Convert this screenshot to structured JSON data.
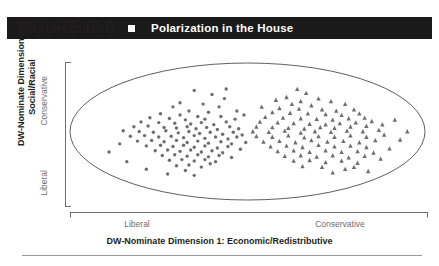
{
  "header": {
    "figure_number": "FIGURE 15.6",
    "bullet_icon": "square-bullet-icon",
    "title": "Polarization in the House",
    "background_color": "#1a1a1a",
    "text_color": "#ffffff"
  },
  "chart_data": {
    "type": "scatter",
    "title": "Polarization in the House",
    "xlabel": "DW-Nominate Dimension 1: Economic/Redistributive",
    "ylabel_line1": "DW-Nominate Dimension 2:",
    "ylabel_line2": "Social/Racial",
    "xtick_labels": [
      "Liberal",
      "Conservative"
    ],
    "ytick_labels": [
      "Liberal",
      "Conservative"
    ],
    "xlim": [
      -1,
      1
    ],
    "ylim": [
      -1,
      1
    ],
    "grid": false,
    "legend": "none",
    "boundary_shape": "ellipse",
    "marker_color": "#6d6e70",
    "series": [
      {
        "name": "Democrats",
        "marker": "circle",
        "cluster_center": [
          -0.45,
          0.0
        ],
        "points": [
          [
            -0.3,
            0.6
          ],
          [
            -0.2,
            0.54
          ],
          [
            -0.12,
            0.62
          ],
          [
            -0.38,
            0.42
          ],
          [
            -0.25,
            0.4
          ],
          [
            -0.42,
            0.36
          ],
          [
            -0.16,
            0.36
          ],
          [
            -0.33,
            0.3
          ],
          [
            -0.49,
            0.26
          ],
          [
            -0.22,
            0.28
          ],
          [
            -0.38,
            0.24
          ],
          [
            -0.28,
            0.22
          ],
          [
            -0.55,
            0.2
          ],
          [
            -0.44,
            0.19
          ],
          [
            -0.35,
            0.17
          ],
          [
            -0.24,
            0.18
          ],
          [
            -0.15,
            0.22
          ],
          [
            -0.6,
            0.14
          ],
          [
            -0.5,
            0.13
          ],
          [
            -0.41,
            0.12
          ],
          [
            -0.32,
            0.11
          ],
          [
            -0.26,
            0.13
          ],
          [
            -0.19,
            0.1
          ],
          [
            -0.12,
            0.14
          ],
          [
            -0.07,
            0.18
          ],
          [
            -0.64,
            0.07
          ],
          [
            -0.56,
            0.08
          ],
          [
            -0.47,
            0.06
          ],
          [
            -0.4,
            0.05
          ],
          [
            -0.34,
            0.07
          ],
          [
            -0.29,
            0.04
          ],
          [
            -0.23,
            0.06
          ],
          [
            -0.17,
            0.03
          ],
          [
            -0.1,
            0.07
          ],
          [
            -0.05,
            0.04
          ],
          [
            -0.7,
            0.01
          ],
          [
            -0.61,
            0.0
          ],
          [
            -0.53,
            -0.01
          ],
          [
            -0.46,
            0.01
          ],
          [
            -0.39,
            -0.02
          ],
          [
            -0.33,
            0.0
          ],
          [
            -0.27,
            -0.03
          ],
          [
            -0.21,
            -0.01
          ],
          [
            -0.14,
            -0.04
          ],
          [
            -0.08,
            -0.01
          ],
          [
            -0.03,
            -0.05
          ],
          [
            -0.66,
            -0.07
          ],
          [
            -0.58,
            -0.06
          ],
          [
            -0.5,
            -0.08
          ],
          [
            -0.43,
            -0.07
          ],
          [
            -0.36,
            -0.09
          ],
          [
            -0.3,
            -0.06
          ],
          [
            -0.24,
            -0.1
          ],
          [
            -0.18,
            -0.08
          ],
          [
            -0.11,
            -0.11
          ],
          [
            -0.06,
            -0.08
          ],
          [
            -0.62,
            -0.14
          ],
          [
            -0.54,
            -0.13
          ],
          [
            -0.47,
            -0.15
          ],
          [
            -0.4,
            -0.13
          ],
          [
            -0.34,
            -0.16
          ],
          [
            -0.28,
            -0.14
          ],
          [
            -0.22,
            -0.17
          ],
          [
            -0.15,
            -0.15
          ],
          [
            -0.09,
            -0.18
          ],
          [
            -0.57,
            -0.21
          ],
          [
            -0.49,
            -0.2
          ],
          [
            -0.42,
            -0.22
          ],
          [
            -0.36,
            -0.2
          ],
          [
            -0.3,
            -0.23
          ],
          [
            -0.24,
            -0.21
          ],
          [
            -0.17,
            -0.24
          ],
          [
            -0.11,
            -0.22
          ],
          [
            -0.52,
            -0.28
          ],
          [
            -0.45,
            -0.27
          ],
          [
            -0.38,
            -0.29
          ],
          [
            -0.32,
            -0.27
          ],
          [
            -0.26,
            -0.3
          ],
          [
            -0.2,
            -0.28
          ],
          [
            -0.14,
            -0.31
          ],
          [
            -0.48,
            -0.35
          ],
          [
            -0.41,
            -0.34
          ],
          [
            -0.34,
            -0.36
          ],
          [
            -0.28,
            -0.34
          ],
          [
            -0.22,
            -0.37
          ],
          [
            -0.16,
            -0.35
          ],
          [
            -0.44,
            -0.42
          ],
          [
            -0.37,
            -0.41
          ],
          [
            -0.3,
            -0.43
          ],
          [
            -0.24,
            -0.41
          ],
          [
            -0.18,
            -0.44
          ],
          [
            -0.4,
            -0.5
          ],
          [
            -0.33,
            -0.49
          ],
          [
            -0.26,
            -0.52
          ],
          [
            -0.72,
            -0.18
          ],
          [
            -0.78,
            -0.3
          ],
          [
            -0.68,
            -0.44
          ],
          [
            -0.57,
            -0.55
          ],
          [
            -0.45,
            -0.62
          ],
          [
            -0.3,
            -0.64
          ],
          [
            -0.13,
            0.48
          ],
          [
            -0.06,
            0.3
          ],
          [
            -0.02,
            0.24
          ],
          [
            -0.01,
            -0.16
          ],
          [
            -0.04,
            -0.26
          ],
          [
            -0.09,
            -0.38
          ],
          [
            -0.21,
            -0.47
          ],
          [
            -0.35,
            -0.57
          ]
        ]
      },
      {
        "name": "Republicans",
        "marker": "triangle",
        "cluster_center": [
          0.4,
          0.0
        ],
        "points": [
          [
            0.28,
            0.62
          ],
          [
            0.33,
            0.56
          ],
          [
            0.22,
            0.5
          ],
          [
            0.4,
            0.48
          ],
          [
            0.3,
            0.44
          ],
          [
            0.47,
            0.44
          ],
          [
            0.25,
            0.4
          ],
          [
            0.36,
            0.38
          ],
          [
            0.55,
            0.4
          ],
          [
            0.18,
            0.34
          ],
          [
            0.29,
            0.33
          ],
          [
            0.42,
            0.32
          ],
          [
            0.5,
            0.3
          ],
          [
            0.6,
            0.32
          ],
          [
            0.14,
            0.28
          ],
          [
            0.24,
            0.27
          ],
          [
            0.34,
            0.26
          ],
          [
            0.44,
            0.25
          ],
          [
            0.53,
            0.24
          ],
          [
            0.63,
            0.26
          ],
          [
            0.1,
            0.21
          ],
          [
            0.2,
            0.2
          ],
          [
            0.3,
            0.19
          ],
          [
            0.39,
            0.18
          ],
          [
            0.48,
            0.17
          ],
          [
            0.57,
            0.19
          ],
          [
            0.66,
            0.2
          ],
          [
            0.07,
            0.14
          ],
          [
            0.17,
            0.13
          ],
          [
            0.26,
            0.12
          ],
          [
            0.35,
            0.11
          ],
          [
            0.44,
            0.1
          ],
          [
            0.52,
            0.12
          ],
          [
            0.61,
            0.13
          ],
          [
            0.7,
            0.15
          ],
          [
            0.05,
            0.07
          ],
          [
            0.14,
            0.06
          ],
          [
            0.23,
            0.05
          ],
          [
            0.32,
            0.04
          ],
          [
            0.41,
            0.06
          ],
          [
            0.49,
            0.05
          ],
          [
            0.58,
            0.07
          ],
          [
            0.67,
            0.08
          ],
          [
            0.76,
            0.1
          ],
          [
            0.03,
            0.0
          ],
          [
            0.12,
            -0.01
          ],
          [
            0.21,
            0.01
          ],
          [
            0.3,
            -0.02
          ],
          [
            0.38,
            0.0
          ],
          [
            0.47,
            -0.01
          ],
          [
            0.56,
            0.01
          ],
          [
            0.65,
            0.0
          ],
          [
            0.74,
            0.02
          ],
          [
            0.05,
            -0.07
          ],
          [
            0.14,
            -0.08
          ],
          [
            0.23,
            -0.06
          ],
          [
            0.32,
            -0.09
          ],
          [
            0.4,
            -0.07
          ],
          [
            0.49,
            -0.08
          ],
          [
            0.58,
            -0.06
          ],
          [
            0.67,
            -0.08
          ],
          [
            0.77,
            -0.05
          ],
          [
            0.09,
            -0.15
          ],
          [
            0.18,
            -0.14
          ],
          [
            0.27,
            -0.16
          ],
          [
            0.36,
            -0.13
          ],
          [
            0.45,
            -0.15
          ],
          [
            0.54,
            -0.14
          ],
          [
            0.63,
            -0.16
          ],
          [
            0.72,
            -0.13
          ],
          [
            0.13,
            -0.22
          ],
          [
            0.22,
            -0.21
          ],
          [
            0.31,
            -0.23
          ],
          [
            0.4,
            -0.2
          ],
          [
            0.49,
            -0.22
          ],
          [
            0.58,
            -0.21
          ],
          [
            0.67,
            -0.23
          ],
          [
            0.17,
            -0.29
          ],
          [
            0.26,
            -0.28
          ],
          [
            0.35,
            -0.3
          ],
          [
            0.44,
            -0.28
          ],
          [
            0.53,
            -0.3
          ],
          [
            0.62,
            -0.29
          ],
          [
            0.71,
            -0.31
          ],
          [
            0.21,
            -0.36
          ],
          [
            0.3,
            -0.35
          ],
          [
            0.39,
            -0.37
          ],
          [
            0.48,
            -0.35
          ],
          [
            0.57,
            -0.38
          ],
          [
            0.66,
            -0.36
          ],
          [
            0.26,
            -0.43
          ],
          [
            0.35,
            -0.42
          ],
          [
            0.44,
            -0.45
          ],
          [
            0.53,
            -0.43
          ],
          [
            0.62,
            -0.46
          ],
          [
            0.31,
            -0.51
          ],
          [
            0.42,
            -0.52
          ],
          [
            0.55,
            -0.55
          ],
          [
            0.68,
            -0.58
          ],
          [
            0.8,
            -0.25
          ],
          [
            0.86,
            -0.12
          ],
          [
            0.9,
            0.0
          ],
          [
            0.83,
            0.17
          ],
          [
            0.75,
            -0.4
          ],
          [
            0.16,
            0.46
          ],
          [
            0.08,
            0.36
          ],
          [
            0.6,
            -0.52
          ],
          [
            0.48,
            -0.6
          ]
        ]
      }
    ]
  },
  "axes": {
    "y_title_line1": "DW-Nominate Dimension 2:",
    "y_title_line2": "Social/Racial",
    "y_tick_top": "Conservative",
    "y_tick_bottom": "Liberal",
    "x_tick_left": "Liberal",
    "x_tick_right": "Conservative",
    "x_title": "DW-Nominate Dimension 1: Economic/Redistributive",
    "tick_label_color": "#6d6e70"
  }
}
